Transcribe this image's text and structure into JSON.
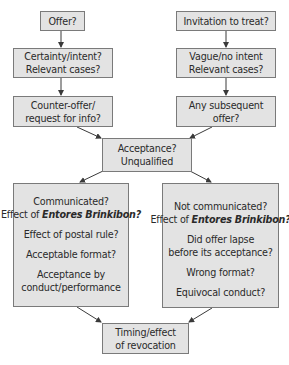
{
  "diagram": {
    "left_column": {
      "offer": {
        "lines": [
          "Offer?"
        ]
      },
      "certainty": {
        "lines": [
          "Certainty/intent?",
          "Relevant cases?"
        ]
      },
      "counter_offer": {
        "lines": [
          "Counter-offer/",
          "request for info?"
        ]
      }
    },
    "right_column": {
      "invitation": {
        "lines": [
          "Invitation to treat?"
        ]
      },
      "vague": {
        "lines": [
          "Vague/no intent",
          "Relevant cases?"
        ]
      },
      "subsequent": {
        "lines": [
          "Any subsequent",
          "offer?"
        ]
      }
    },
    "acceptance": {
      "lines": [
        "Acceptance?",
        "Unqualified"
      ]
    },
    "communicated_box": {
      "line1": "Communicated?",
      "line2_prefix": "Effect of ",
      "line2_case": "Entores Brinkibon?",
      "line3": "Effect of postal rule?",
      "line4": "Acceptable format?",
      "line5": "Acceptance by",
      "line6": "conduct/performance"
    },
    "not_communicated_box": {
      "line1": "Not communicated?",
      "line2_prefix": "Effect of ",
      "line2_case": "Entores Brinkibon?",
      "line3": "Did offer lapse",
      "line4": "before its acceptance?",
      "line5": "Wrong format?",
      "line6": "Equivocal conduct?"
    },
    "revocation": {
      "lines": [
        "Timing/effect",
        "of revocation"
      ]
    },
    "colors": {
      "box_fill": "#e3e3e3",
      "box_border": "#7a7a7a",
      "arrow": "#3a3a3a",
      "text": "#2a2a2a"
    }
  }
}
